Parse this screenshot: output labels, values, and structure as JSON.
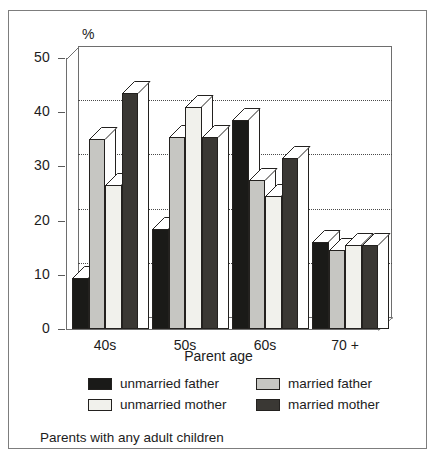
{
  "chart_data": {
    "type": "bar",
    "title": "",
    "caption": "Parents with any adult children",
    "xlabel": "Parent age",
    "ylabel": "%",
    "ylim": [
      0,
      50
    ],
    "yticks": [
      0,
      10,
      20,
      30,
      40,
      50
    ],
    "grid": true,
    "grid_axis": "y",
    "legend_position": "below-plot",
    "categories": [
      "40s",
      "50s",
      "60s",
      "70 +"
    ],
    "series": [
      {
        "name": "unmarried father",
        "color": "#1a1a18",
        "values": [
          9.5,
          18.5,
          38.5,
          16.0
        ]
      },
      {
        "name": "married father",
        "color": "#c6c6c2",
        "values": [
          35.0,
          35.5,
          27.5,
          14.5
        ]
      },
      {
        "name": "unmarried mother",
        "color": "#f1f1ec",
        "values": [
          26.5,
          41.0,
          24.5,
          15.5
        ]
      },
      {
        "name": "married mother",
        "color": "#3a3834",
        "values": [
          43.5,
          35.5,
          31.5,
          15.5
        ]
      }
    ]
  },
  "axis": {
    "y_unit_label": "%",
    "x_title": "Parent age",
    "y_tick_labels": [
      "50",
      "40",
      "30",
      "20",
      "10",
      "0"
    ],
    "x_tick_labels": [
      "40s",
      "50s",
      "60s",
      "70 +"
    ]
  },
  "legend": {
    "entries": [
      {
        "label": "unmarried father",
        "color": "#1a1a18"
      },
      {
        "label": "married father",
        "color": "#c6c6c2"
      },
      {
        "label": "unmarried mother",
        "color": "#f1f1ec"
      },
      {
        "label": "married mother",
        "color": "#3a3834"
      }
    ]
  },
  "footer": {
    "caption": "Parents with any adult children"
  }
}
